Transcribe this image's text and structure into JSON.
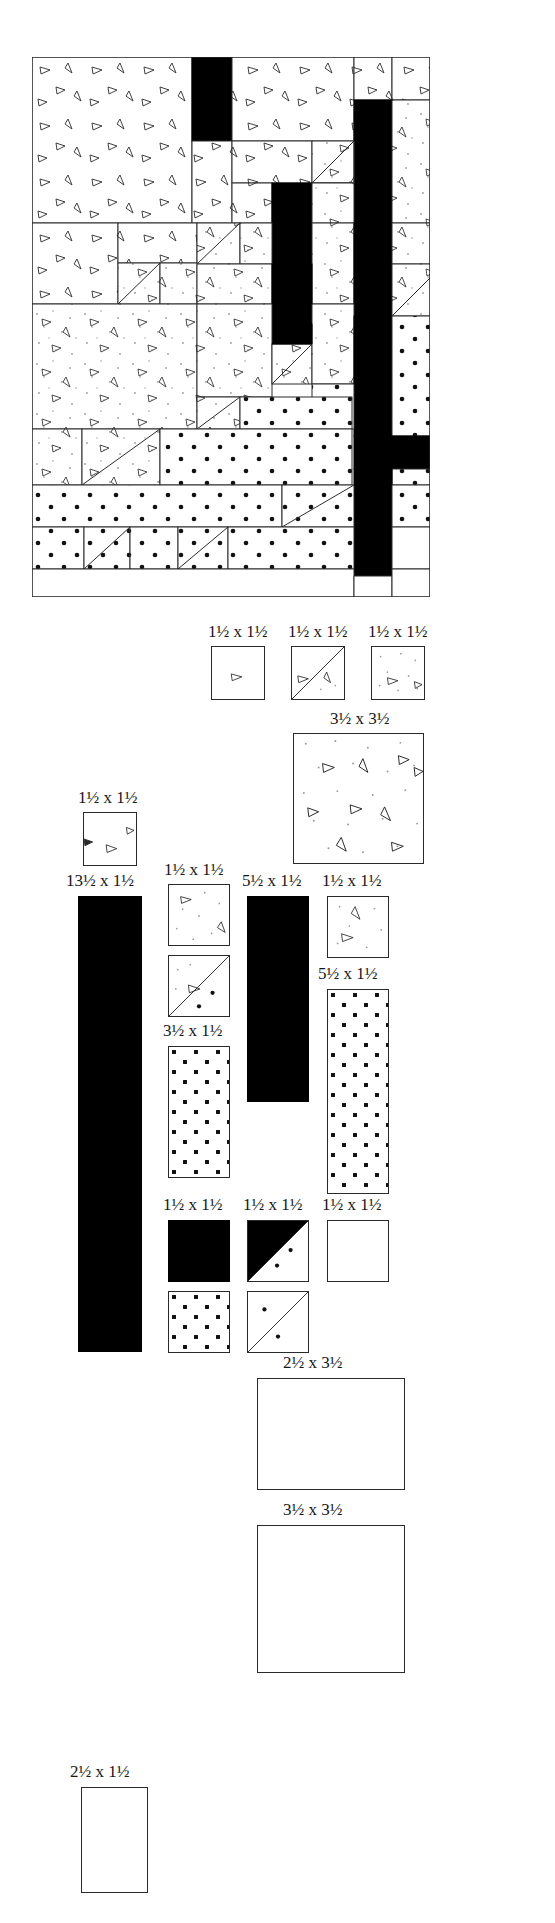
{
  "document": {
    "type": "quilt-block-pattern-diagram",
    "title": "Saguaro Cactus Quilt Block — Piecing Diagram and Cutting List"
  },
  "block": {
    "name": "cactus-block",
    "description": "Pieced cactus block shown as a grid of patchwork units",
    "fabrics": {
      "background_print": "white with small scattered triangle motifs",
      "cactus_print": "light grey dotted print with triangle motifs",
      "polka_dot": "white with bold black polka dots",
      "solid_black": "solid black",
      "plain_white": "plain white"
    }
  },
  "fraction": {
    "numerator": "1",
    "denominator": "2"
  },
  "symbols": {
    "times": "x",
    "half": "½"
  },
  "cutting_list": [
    {
      "id": "p1",
      "size": "1½ x 1½",
      "whole_w": "1",
      "whole_h": "1",
      "fabric": "background_print",
      "shape": "square"
    },
    {
      "id": "p2",
      "size": "1½ x 1½",
      "whole_w": "1",
      "whole_h": "1",
      "fabric": "background_print",
      "shape": "half-square-triangle"
    },
    {
      "id": "p3",
      "size": "1½ x 1½",
      "whole_w": "1",
      "whole_h": "1",
      "fabric": "cactus_print",
      "shape": "square"
    },
    {
      "id": "p4",
      "size": "3½ x 3½",
      "whole_w": "3",
      "whole_h": "3",
      "fabric": "cactus_print",
      "shape": "square"
    },
    {
      "id": "p5",
      "size": "1½ x 1½",
      "whole_w": "1",
      "whole_h": "1",
      "fabric": "background_print",
      "shape": "square"
    },
    {
      "id": "p6",
      "size": "13½ x 1½",
      "whole_w": "13",
      "whole_h": "1",
      "fabric": "solid_black",
      "shape": "rectangle"
    },
    {
      "id": "p7",
      "size": "1½ x 1½",
      "whole_w": "1",
      "whole_h": "1",
      "fabric": "cactus_print",
      "shape": "square"
    },
    {
      "id": "p8",
      "size": "1½ x 1½",
      "whole_w": "1",
      "whole_h": "1",
      "fabric": "cactus_print",
      "shape": "half-square-triangle"
    },
    {
      "id": "p9",
      "size": "3½ x 1½",
      "whole_w": "3",
      "whole_h": "1",
      "fabric": "polka_dot",
      "shape": "rectangle"
    },
    {
      "id": "p10",
      "size": "5½ x 1½",
      "whole_w": "5",
      "whole_h": "1",
      "fabric": "solid_black",
      "shape": "rectangle"
    },
    {
      "id": "p11",
      "size": "1½ x 1½",
      "whole_w": "1",
      "whole_h": "1",
      "fabric": "cactus_print",
      "shape": "square"
    },
    {
      "id": "p12",
      "size": "5½ x 1½",
      "whole_w": "5",
      "whole_h": "1",
      "fabric": "polka_dot",
      "shape": "rectangle"
    },
    {
      "id": "p13",
      "size": "1½ x 1½",
      "whole_w": "1",
      "whole_h": "1",
      "fabric": "solid_black",
      "shape": "square"
    },
    {
      "id": "p14",
      "size": "1½ x 1½",
      "whole_w": "1",
      "whole_h": "1",
      "fabric": "black_polka_hst",
      "shape": "half-square-triangle"
    },
    {
      "id": "p15",
      "size": "1½ x 1½",
      "whole_w": "1",
      "whole_h": "1",
      "fabric": "polka_dot",
      "shape": "square"
    },
    {
      "id": "p16",
      "size": "1½ x 1½",
      "whole_w": "1",
      "whole_h": "1",
      "fabric": "polka_dot",
      "shape": "half-square-triangle"
    },
    {
      "id": "p17",
      "size": "1½ x 1½",
      "whole_w": "1",
      "whole_h": "1",
      "fabric": "plain_white",
      "shape": "square"
    },
    {
      "id": "p18",
      "size": "2½ x 3½",
      "whole_w": "2",
      "whole_h": "3",
      "fabric": "plain_white",
      "shape": "rectangle"
    },
    {
      "id": "p19",
      "size": "3½ x 3½",
      "whole_w": "3",
      "whole_h": "3",
      "fabric": "plain_white",
      "shape": "square"
    },
    {
      "id": "p20",
      "size": "2½ x 1½",
      "whole_w": "2",
      "whole_h": "1",
      "fabric": "plain_white",
      "shape": "rectangle"
    }
  ],
  "labels": {
    "l_r1c1": "1½ x 1½",
    "l_r1c2": "1½ x 1½",
    "l_r1c3": "1½ x 1½",
    "l_big": "3½ x 3½",
    "l_left_small": "1½ x 1½",
    "l_left_long": "13½ x 1½",
    "l_mid_small": "1½ x 1½",
    "l_mid_rect": "3½ x 1½",
    "l_blackbar": "5½ x 1½",
    "l_right_small": "1½ x 1½",
    "l_right_tall": "5½ x 1½",
    "l_black_sq": "1½ x 1½",
    "l_hst": "1½ x 1½",
    "l_white_sq": "1½ x 1½",
    "l_white_rect": "2½ x 3½",
    "l_white_big": "3½ x 3½",
    "l_bottom_left": "2½ x 1½"
  }
}
